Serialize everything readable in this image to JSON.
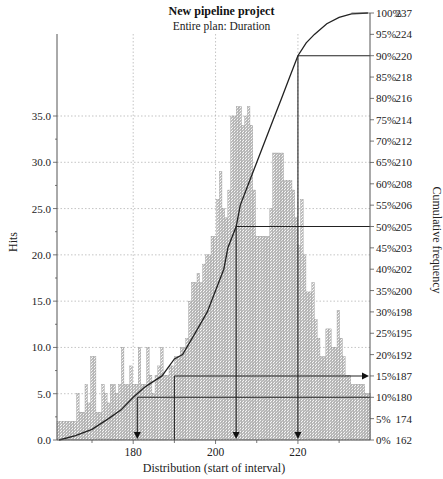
{
  "chart_data": {
    "type": "bar",
    "title": "New pipeline project",
    "subtitle": "Entire plan: Duration",
    "xlabel": "Distribution (start of interval)",
    "ylabel": "Hits",
    "y2label": "Cumulative frequency",
    "xlim": [
      161.5,
      237.5
    ],
    "ylim": [
      0,
      38.5
    ],
    "x_ticks": [
      180,
      200,
      220
    ],
    "x_minor_ticks": [
      170,
      190,
      210,
      230
    ],
    "y_ticks": [
      "0.0",
      "5.0",
      "10.0",
      "15.0",
      "20.0",
      "25.0",
      "30.0",
      "35.0"
    ],
    "y_tick_values": [
      0,
      5,
      10,
      15,
      20,
      25,
      30,
      35
    ],
    "grid": true,
    "bar_width": 0.68,
    "bar_x_start": 161.5,
    "values": [
      2,
      2,
      2,
      2,
      2,
      2,
      2,
      5,
      3,
      3,
      6,
      4,
      9,
      9,
      3,
      3,
      6,
      5,
      4,
      6,
      6,
      5,
      6,
      10,
      6,
      6,
      8,
      6,
      6,
      10,
      6,
      6,
      10,
      7,
      5,
      7,
      8,
      10,
      7,
      7,
      8,
      8,
      9,
      9,
      10,
      10,
      11,
      15,
      17,
      17,
      18,
      17,
      19,
      20,
      20,
      22,
      22,
      26,
      29,
      25,
      24,
      27,
      35,
      35,
      36,
      36,
      34,
      35,
      36,
      34,
      27,
      22,
      22,
      22,
      22,
      22,
      25,
      31,
      31,
      31,
      31,
      28,
      28,
      28,
      27,
      24,
      21,
      26,
      20,
      16,
      16,
      17,
      13,
      11,
      9,
      9,
      12,
      12,
      10,
      10,
      14,
      11,
      9,
      7,
      7,
      6,
      6,
      6,
      6,
      6,
      5,
      5,
      4,
      3,
      3,
      3,
      2,
      2,
      1,
      1,
      1
    ],
    "cumulative_axis": [
      {
        "pct": "100%",
        "val": "237",
        "frac": 1.0
      },
      {
        "pct": "95%",
        "val": "224",
        "frac": 0.95
      },
      {
        "pct": "90%",
        "val": "220",
        "frac": 0.9
      },
      {
        "pct": "85%",
        "val": "218",
        "frac": 0.85
      },
      {
        "pct": "80%",
        "val": "216",
        "frac": 0.8
      },
      {
        "pct": "75%",
        "val": "214",
        "frac": 0.75
      },
      {
        "pct": "70%",
        "val": "212",
        "frac": 0.7
      },
      {
        "pct": "65%",
        "val": "210",
        "frac": 0.65
      },
      {
        "pct": "60%",
        "val": "208",
        "frac": 0.6
      },
      {
        "pct": "55%",
        "val": "206",
        "frac": 0.55
      },
      {
        "pct": "50%",
        "val": "205",
        "frac": 0.5
      },
      {
        "pct": "45%",
        "val": "203",
        "frac": 0.45
      },
      {
        "pct": "40%",
        "val": "202",
        "frac": 0.4
      },
      {
        "pct": "35%",
        "val": "200",
        "frac": 0.35
      },
      {
        "pct": "30%",
        "val": "198",
        "frac": 0.3
      },
      {
        "pct": "25%",
        "val": "195",
        "frac": 0.25
      },
      {
        "pct": "20%",
        "val": "192",
        "frac": 0.2
      },
      {
        "pct": "15%",
        "val": "187",
        "frac": 0.15
      },
      {
        "pct": "10%",
        "val": "180",
        "frac": 0.1
      },
      {
        "pct": "5%",
        "val": "174",
        "frac": 0.05
      },
      {
        "pct": "0%",
        "val": "162",
        "frac": 0.0
      }
    ],
    "cumulative_curve": [
      [
        162,
        0.0
      ],
      [
        166,
        0.01
      ],
      [
        170,
        0.025
      ],
      [
        174,
        0.05
      ],
      [
        177,
        0.07
      ],
      [
        180,
        0.1
      ],
      [
        183,
        0.125
      ],
      [
        187,
        0.15
      ],
      [
        190,
        0.19
      ],
      [
        192,
        0.2
      ],
      [
        195,
        0.25
      ],
      [
        198,
        0.3
      ],
      [
        200,
        0.35
      ],
      [
        202,
        0.4
      ],
      [
        203,
        0.45
      ],
      [
        205,
        0.5
      ],
      [
        206,
        0.55
      ],
      [
        208,
        0.6
      ],
      [
        210,
        0.65
      ],
      [
        212,
        0.7
      ],
      [
        214,
        0.75
      ],
      [
        216,
        0.8
      ],
      [
        218,
        0.85
      ],
      [
        220,
        0.9
      ],
      [
        222,
        0.93
      ],
      [
        224,
        0.95
      ],
      [
        227,
        0.975
      ],
      [
        230,
        0.99
      ],
      [
        233,
        0.998
      ],
      [
        237,
        1.0
      ]
    ],
    "markers": [
      {
        "label": "10%",
        "x": 181,
        "frac": 0.1,
        "direction": "down"
      },
      {
        "label": "15%",
        "x": 190,
        "frac": 0.15,
        "direction": "right"
      },
      {
        "label": "50%",
        "x": 205,
        "frac": 0.5,
        "direction": "down"
      },
      {
        "label": "90%",
        "x": 220,
        "frac": 0.9,
        "direction": "down"
      }
    ]
  }
}
